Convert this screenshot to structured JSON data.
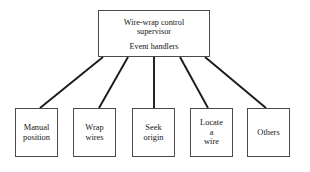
{
  "diagram": {
    "type": "tree-hierarchy",
    "title_text": "Wire-wrap control supervisor event handlers",
    "root": {
      "name": "wire-wrap-control-supervisor",
      "lines": [
        "Wire-wrap control",
        "supervisor"
      ],
      "group_label": "Event handlers",
      "box": {
        "x": 98,
        "y": 10,
        "w": 112,
        "h": 47
      }
    },
    "children": [
      {
        "name": "manual-position",
        "lines": [
          "Manual",
          "position"
        ],
        "box": {
          "x": 15,
          "y": 108,
          "w": 43,
          "h": 49
        },
        "connector": {
          "x1": 103,
          "y1": 57,
          "x2": 40,
          "y2": 108
        }
      },
      {
        "name": "wrap-wires",
        "lines": [
          "Wrap",
          "wires"
        ],
        "box": {
          "x": 73,
          "y": 108,
          "w": 43,
          "h": 49
        },
        "connector": {
          "x1": 128,
          "y1": 57,
          "x2": 99,
          "y2": 108
        }
      },
      {
        "name": "seek-origin",
        "lines": [
          "Seek",
          "origin"
        ],
        "box": {
          "x": 132,
          "y": 108,
          "w": 43,
          "h": 49
        },
        "connector": {
          "x1": 154,
          "y1": 57,
          "x2": 154,
          "y2": 108
        }
      },
      {
        "name": "locate-a-wire",
        "lines": [
          "Locate",
          "a",
          "wire"
        ],
        "box": {
          "x": 190,
          "y": 108,
          "w": 43,
          "h": 49
        },
        "connector": {
          "x1": 180,
          "y1": 57,
          "x2": 208,
          "y2": 108
        }
      },
      {
        "name": "others",
        "lines": [
          "Others"
        ],
        "box": {
          "x": 247,
          "y": 108,
          "w": 43,
          "h": 49
        },
        "connector": {
          "x1": 205,
          "y1": 57,
          "x2": 266,
          "y2": 108
        }
      }
    ],
    "style": {
      "background": "#ffffff",
      "box_border_color": "#4a4a4a",
      "connector_color": "#1a1a1a",
      "text_color": "#151515",
      "connector_width": 1.9,
      "box_border_width": 1
    }
  }
}
